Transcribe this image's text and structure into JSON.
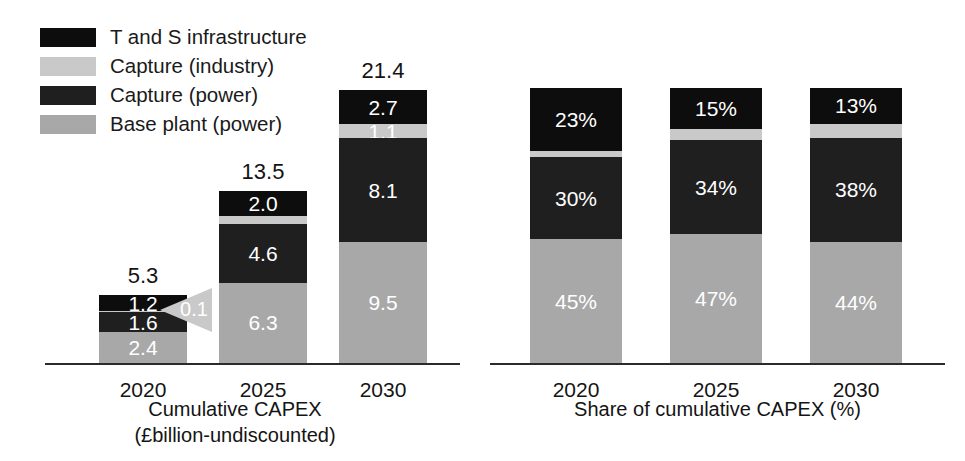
{
  "legend": {
    "items": [
      {
        "label": "T and S infrastructure",
        "color": "#0d0d0d",
        "key": "tands"
      },
      {
        "label": "Capture (industry)",
        "color": "#c9c9c9",
        "key": "capture_industry"
      },
      {
        "label": "Capture (power)",
        "color": "#1f1f1f",
        "key": "capture_power"
      },
      {
        "label": "Base plant (power)",
        "color": "#a8a8a8",
        "key": "base_plant_power"
      }
    ]
  },
  "colors": {
    "tands": "#0d0d0d",
    "capture_industry": "#c9c9c9",
    "capture_power": "#1f1f1f",
    "base_plant_power": "#a8a8a8",
    "axis": "#2b2b2b",
    "callout": "#c9c9c9",
    "text_dark": "#141414",
    "text_light": "#ffffff"
  },
  "annotation": {
    "callout_value": "0.1",
    "callout_points_to": "Capture (industry) segment of 2020 bar"
  },
  "chart_data": [
    {
      "type": "bar",
      "id": "cumulative-capex",
      "stacked": true,
      "title": "",
      "xlabel": "Cumulative CAPEX\n(£billion-undiscounted)",
      "xlabel_line1": "Cumulative CAPEX",
      "xlabel_line2": "(£billion-undiscounted)",
      "ylabel": "",
      "ylim": [
        0,
        21.4
      ],
      "grid": false,
      "legend_position": "top-left",
      "categories": [
        "2020",
        "2025",
        "2030"
      ],
      "totals": [
        5.3,
        13.5,
        21.4
      ],
      "total_labels": [
        "5.3",
        "13.5",
        "21.4"
      ],
      "series": [
        {
          "name": "Base plant (power)",
          "key": "base_plant_power",
          "values": [
            2.4,
            6.3,
            9.5
          ],
          "labels": [
            "2.4",
            "6.3",
            "9.5"
          ]
        },
        {
          "name": "Capture (power)",
          "key": "capture_power",
          "values": [
            1.6,
            4.6,
            8.1
          ],
          "labels": [
            "1.6",
            "4.6",
            "8.1"
          ]
        },
        {
          "name": "Capture (industry)",
          "key": "capture_industry",
          "values": [
            0.1,
            0.6,
            1.1
          ],
          "labels": [
            "0.1",
            "0.6",
            "1.1"
          ]
        },
        {
          "name": "T and S infrastructure",
          "key": "tands",
          "values": [
            1.2,
            2.0,
            2.7
          ],
          "labels": [
            "1.2",
            "2.0",
            "2.7"
          ]
        }
      ]
    },
    {
      "type": "bar",
      "id": "share-of-cumulative-capex",
      "stacked": true,
      "title": "",
      "xlabel": "Share of cumulative CAPEX (%)",
      "ylabel": "",
      "ylim": [
        0,
        100
      ],
      "grid": false,
      "legend_position": "shared",
      "categories": [
        "2020",
        "2025",
        "2030"
      ],
      "totals": [
        100,
        100,
        100
      ],
      "series": [
        {
          "name": "Base plant (power)",
          "key": "base_plant_power",
          "values": [
            45,
            47,
            44
          ],
          "labels": [
            "45%",
            "47%",
            "44%"
          ]
        },
        {
          "name": "Capture (power)",
          "key": "capture_power",
          "values": [
            30,
            34,
            38
          ],
          "labels": [
            "30%",
            "34%",
            "38%"
          ]
        },
        {
          "name": "Capture (industry)",
          "key": "capture_industry",
          "values": [
            2,
            4,
            5
          ],
          "labels": [
            "2%",
            "4%",
            "5%"
          ]
        },
        {
          "name": "T and S infrastructure",
          "key": "tands",
          "values": [
            23,
            15,
            13
          ],
          "labels": [
            "23%",
            "15%",
            "13%"
          ]
        }
      ]
    }
  ]
}
